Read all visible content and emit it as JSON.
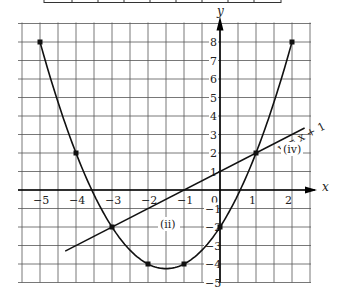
{
  "chart_data": {
    "type": "line",
    "title": "",
    "xlabel": "x",
    "ylabel": "y",
    "xlim": [
      -5.5,
      2.5
    ],
    "ylim": [
      -5,
      9
    ],
    "grid": true,
    "x_ticks": [
      -5,
      -4,
      -3,
      -2,
      -1,
      0,
      1,
      2
    ],
    "x_tick_labels": [
      "−5",
      "−4",
      "−3",
      "−2",
      "−1",
      "0",
      "1",
      "2"
    ],
    "y_ticks": [
      8,
      7,
      6,
      5,
      4,
      3,
      2,
      1,
      -1,
      -2,
      -3,
      -4,
      -5
    ],
    "y_tick_labels": [
      "8",
      "7",
      "6",
      "5",
      "4",
      "3",
      "2",
      "1",
      "−1",
      "−2",
      "−3",
      "−4",
      "−5"
    ],
    "series": [
      {
        "name": "curve",
        "equation": "y = x² + 3x − 2",
        "x": [
          -5,
          -4,
          -3,
          -2,
          -1,
          0,
          1,
          2
        ],
        "values": [
          8,
          2,
          -2,
          -4,
          -4,
          -2,
          2,
          8
        ],
        "marked_points": [
          [
            -5,
            8
          ],
          [
            -4,
            2
          ],
          [
            -3,
            -2
          ],
          [
            -2,
            -4
          ],
          [
            -1,
            -4
          ],
          [
            0,
            -2
          ],
          [
            1,
            2
          ],
          [
            2,
            8
          ]
        ]
      },
      {
        "name": "line",
        "equation": "y = x + 1",
        "x": [
          -4.3,
          2.35
        ],
        "values": [
          -3.3,
          3.35
        ]
      }
    ],
    "annotations": [
      {
        "text": "y = x + 1",
        "x": 1.6,
        "y": 1.7,
        "rotation": -27
      },
      {
        "text": "(iv)",
        "x": 1.7,
        "y": 0.8
      },
      {
        "text": "(ii)",
        "x": -1.3,
        "y": -2.2
      }
    ]
  },
  "labels": {
    "x_axis": "x",
    "y_axis": "y",
    "line_eq": "y = x + 1",
    "part_iv": "(iv)",
    "part_ii": "(ii)"
  },
  "colors": {
    "grid": "#555555",
    "curve": "#111111",
    "axis": "#000000",
    "background": "#ffffff"
  }
}
